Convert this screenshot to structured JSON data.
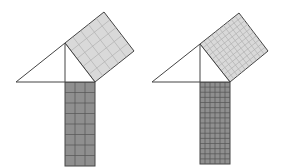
{
  "diagram": {
    "colors": {
      "background": "#ffffff",
      "stroke": "#444444",
      "square_fill": "#d9d9d9",
      "rect_fill": "#8f8f8f",
      "grid_light": "#b0b0b0",
      "grid_dark": "#555555"
    },
    "figures": [
      {
        "id": "left",
        "triangle": [
          [
            16,
            82
          ],
          [
            65,
            43
          ],
          [
            95,
            82
          ]
        ],
        "altitude": [
          [
            65,
            43
          ],
          [
            65,
            82
          ]
        ],
        "square": [
          [
            65,
            43
          ],
          [
            104,
            12
          ],
          [
            134,
            51
          ],
          [
            95,
            82
          ]
        ],
        "square_grid": 5,
        "rect": {
          "x": 65,
          "y": 82,
          "w": 30,
          "h": 84,
          "cols": 3,
          "rows": 8
        }
      },
      {
        "id": "right",
        "triangle": [
          [
            152,
            82
          ],
          [
            200,
            44
          ],
          [
            230,
            82
          ]
        ],
        "altitude": [
          [
            200,
            44
          ],
          [
            200,
            82
          ]
        ],
        "square": [
          [
            200,
            44
          ],
          [
            239,
            13
          ],
          [
            268,
            51
          ],
          [
            230,
            82
          ]
        ],
        "square_grid": 10,
        "rect": {
          "x": 200,
          "y": 82,
          "w": 30,
          "h": 82,
          "cols": 6,
          "rows": 16
        }
      }
    ]
  }
}
